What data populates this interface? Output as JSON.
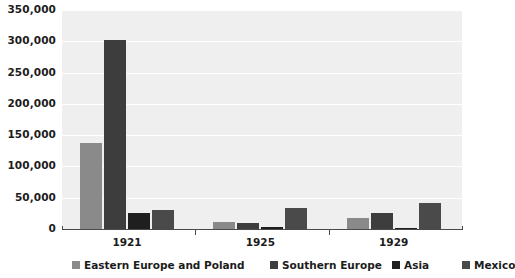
{
  "chart_data": {
    "type": "bar",
    "title": "",
    "subtitle": "",
    "xlabel": "",
    "ylabel": "",
    "categories": [
      "1921",
      "1925",
      "1929"
    ],
    "series": [
      {
        "name": "Eastern Europe and Poland",
        "color": "#8a8a8a",
        "values": [
          138000,
          11000,
          17000
        ]
      },
      {
        "name": "Southern Europe",
        "color": "#3d3d3d",
        "values": [
          302000,
          9000,
          25000
        ]
      },
      {
        "name": "Asia",
        "color": "#1f1f1f",
        "values": [
          25000,
          3000,
          2000
        ]
      },
      {
        "name": "Mexico",
        "color": "#4a4a4a",
        "values": [
          31000,
          33000,
          41000
        ]
      }
    ],
    "ylim": [
      0,
      350000
    ],
    "ytick_step": 50000,
    "yticks": [
      0,
      50000,
      100000,
      150000,
      200000,
      250000,
      300000,
      350000
    ],
    "ytick_labels": [
      "0",
      "50,000",
      "100,000",
      "150,000",
      "200,000",
      "250,000",
      "300,000",
      "350,000"
    ],
    "grid": true,
    "grid_color": "#ffffff",
    "plot_background": "#efefef",
    "legend_position": "bottom",
    "axis_color": "#4a4a4a"
  },
  "legend": {
    "items": [
      {
        "label": "Eastern Europe and Poland",
        "color": "#8a8a8a"
      },
      {
        "label": "Southern Europe",
        "color": "#3d3d3d"
      },
      {
        "label": "Asia",
        "color": "#1f1f1f"
      },
      {
        "label": "Mexico",
        "color": "#4a4a4a"
      }
    ]
  }
}
